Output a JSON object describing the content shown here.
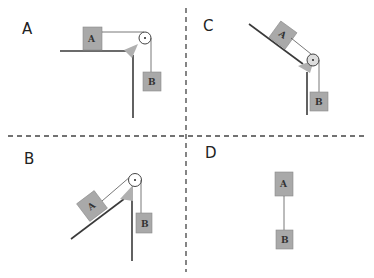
{
  "figure": {
    "colors": {
      "block_fill": "#a9a9a9",
      "block_stroke": "#8a8a8a",
      "surface": "#3a3a3a",
      "rope": "#555555",
      "support": "#b0b0b0",
      "divider": "#444444"
    },
    "panels": [
      {
        "id": "A",
        "label": "A",
        "block_a_label": "A",
        "block_b_label": "B",
        "configuration": "horizontal table with hanging mass"
      },
      {
        "id": "C",
        "label": "C",
        "block_a_label": "A",
        "block_b_label": "B",
        "configuration": "incline descending toward pulley with hanging mass"
      },
      {
        "id": "B",
        "label": "B",
        "block_a_label": "A",
        "block_b_label": "B",
        "configuration": "incline ascending toward pulley with hanging mass"
      },
      {
        "id": "D",
        "label": "D",
        "block_a_label": "A",
        "block_b_label": "B",
        "configuration": "two blocks connected vertically by a string"
      }
    ]
  }
}
